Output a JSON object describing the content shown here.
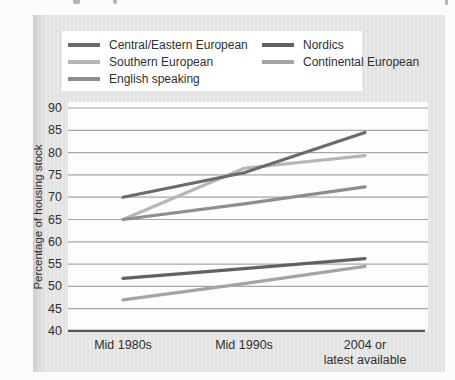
{
  "figure": {
    "background_color": "#e6e6e6",
    "plot_background": "#fdfdfd",
    "legend_background": "#ffffff",
    "text_color": "#2f2f2f"
  },
  "chart_data": {
    "type": "line",
    "title": "",
    "categories": [
      "Mid 1980s",
      "Mid 1990s",
      "2004 or latest available"
    ],
    "xtick_lines": [
      [
        "Mid 1980s"
      ],
      [
        "Mid 1990s"
      ],
      [
        "2004 or",
        "latest available"
      ]
    ],
    "series": [
      {
        "name": "Central/Eastern European",
        "color": "#6b6b6b",
        "values": [
          70,
          75.5,
          84.5
        ]
      },
      {
        "name": "Southern European",
        "color": "#b6b6b6",
        "values": [
          65,
          76.5,
          79.3
        ]
      },
      {
        "name": "English speaking",
        "color": "#8e8e8e",
        "values": [
          65,
          68.5,
          72.3
        ]
      },
      {
        "name": "Nordics",
        "color": "#616161",
        "values": [
          51.8,
          54,
          56.2
        ]
      },
      {
        "name": "Continental European",
        "color": "#a4a4a4",
        "values": [
          47,
          50.6,
          54.5
        ]
      }
    ],
    "xlabel": "",
    "ylabel": "Percentage of housing stock",
    "ylim": [
      40,
      90
    ],
    "yticks": [
      40,
      45,
      50,
      55,
      60,
      65,
      70,
      75,
      80,
      85,
      90
    ],
    "grid": true,
    "legend_position": "top",
    "legend_columns": [
      [
        0,
        1,
        2
      ],
      [
        3,
        4
      ]
    ],
    "axis_color": "#565656",
    "gridline_color": "#a6a6a6",
    "line_width": 3.2
  }
}
